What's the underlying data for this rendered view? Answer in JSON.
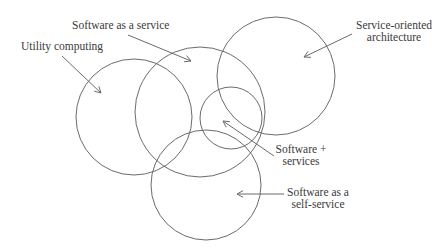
{
  "diagram": {
    "type": "venn-overlap",
    "stroke_color": "#6b6b6b",
    "text_color": "#3a3a3a",
    "circles": [
      {
        "id": "utility-computing",
        "cx": 134,
        "cy": 117,
        "r": 58
      },
      {
        "id": "software-as-a-service",
        "cx": 200,
        "cy": 112,
        "r": 65
      },
      {
        "id": "service-oriented-architecture",
        "cx": 276,
        "cy": 76,
        "r": 59
      },
      {
        "id": "software-plus-services",
        "cx": 231,
        "cy": 118,
        "r": 31
      },
      {
        "id": "software-as-a-self-service",
        "cx": 206,
        "cy": 185,
        "r": 55
      }
    ],
    "labels": {
      "utility_computing": "Utility computing",
      "saas": "Software as a service",
      "soa_line1": "Service-oriented",
      "soa_line2": "architecture",
      "sps_line1": "Software +",
      "sps_line2": "services",
      "self_line1": "Software as a",
      "self_line2": "self-service"
    },
    "arrows": [
      {
        "id": "utility-arrow",
        "x1": 62,
        "y1": 56,
        "x2": 101,
        "y2": 93
      },
      {
        "id": "saas-arrow",
        "x1": 128,
        "y1": 35,
        "x2": 191,
        "y2": 61
      },
      {
        "id": "soa-arrow",
        "x1": 352,
        "y1": 34,
        "x2": 304,
        "y2": 57
      },
      {
        "id": "sps-arrow",
        "x1": 274,
        "y1": 156,
        "x2": 223,
        "y2": 121
      },
      {
        "id": "self-arrow",
        "x1": 284,
        "y1": 194,
        "x2": 237,
        "y2": 194
      }
    ]
  }
}
